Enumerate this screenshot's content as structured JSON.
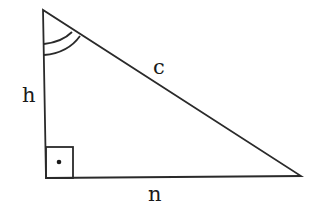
{
  "diagram": {
    "type": "right-triangle",
    "labels": {
      "vertical_side": "h",
      "hypotenuse": "c",
      "horizontal_side": "n"
    },
    "marks": {
      "right_angle": "square with dot at bottom-left vertex",
      "top_angle": "double arc at top vertex"
    },
    "colors": {
      "line": "#2a2a2a",
      "background": "#ffffff"
    }
  }
}
